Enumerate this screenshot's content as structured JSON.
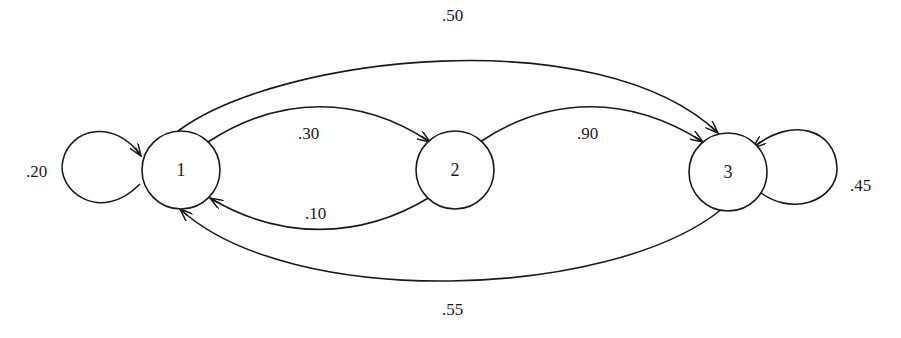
{
  "diagram": {
    "type": "markov-chain-state-transition",
    "nodes": [
      {
        "id": "1",
        "label": "1"
      },
      {
        "id": "2",
        "label": "2"
      },
      {
        "id": "3",
        "label": "3"
      }
    ],
    "edges": [
      {
        "from": "1",
        "to": "1",
        "label": ".20"
      },
      {
        "from": "1",
        "to": "2",
        "label": ".30"
      },
      {
        "from": "1",
        "to": "3",
        "label": ".50"
      },
      {
        "from": "2",
        "to": "1",
        "label": ".10"
      },
      {
        "from": "2",
        "to": "3",
        "label": ".90"
      },
      {
        "from": "3",
        "to": "3",
        "label": ".45"
      },
      {
        "from": "3",
        "to": "1",
        "label": ".55"
      }
    ],
    "colors": {
      "stroke": "#1a1a1a",
      "background": "#ffffff"
    }
  }
}
